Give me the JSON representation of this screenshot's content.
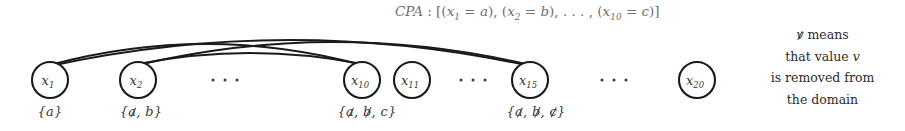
{
  "figure": {
    "width": 905,
    "height": 131,
    "background": "#ffffff",
    "stroke_color": "#1a1a1a",
    "text_color": "#3a3a3a",
    "cpa_text_color": "#6f6f6f"
  },
  "cpa": {
    "prefix": "CPA",
    "separator": " : ",
    "open_bracket": "[",
    "assignments": [
      {
        "var": "x",
        "index": "1",
        "eq": " = ",
        "value": "a"
      },
      {
        "var": "x",
        "index": "2",
        "eq": " = ",
        "value": "b"
      },
      {
        "var": "x",
        "index": "10",
        "eq": " = ",
        "value": "c"
      }
    ],
    "ellipsis": ", . . . ,",
    "close_bracket": "]",
    "full_text": "CPA : [(x1 = a), (x2 = b), . . . , (x10 = c)]"
  },
  "nodes": [
    {
      "id": "x1",
      "var": "x",
      "index": "1",
      "cx": 50,
      "cy": 80,
      "r": 18
    },
    {
      "id": "x2",
      "var": "x",
      "index": "2",
      "cx": 138,
      "cy": 80,
      "r": 18
    },
    {
      "id": "x10",
      "var": "x",
      "index": "10",
      "cx": 362,
      "cy": 80,
      "r": 18
    },
    {
      "id": "x11",
      "var": "x",
      "index": "11",
      "cx": 412,
      "cy": 80,
      "r": 18
    },
    {
      "id": "x15",
      "var": "x",
      "index": "15",
      "cx": 530,
      "cy": 80,
      "r": 18
    },
    {
      "id": "x20",
      "var": "x",
      "index": "20",
      "cx": 697,
      "cy": 80,
      "r": 18
    }
  ],
  "edges": [
    {
      "from": "x1",
      "to": "x10",
      "x1": 50,
      "y1": 65,
      "x2": 362,
      "y2": 65,
      "bow": 42
    },
    {
      "from": "x1",
      "to": "x15",
      "x1": 50,
      "y1": 66,
      "x2": 530,
      "y2": 66,
      "bow": 52
    },
    {
      "from": "x2",
      "to": "x10",
      "x1": 138,
      "y1": 64,
      "x2": 362,
      "y2": 64,
      "bow": 22
    },
    {
      "from": "x2",
      "to": "x15",
      "x1": 138,
      "y1": 65,
      "x2": 530,
      "y2": 65,
      "bow": 46
    }
  ],
  "domains": [
    {
      "node": "x1",
      "cx": 50,
      "text": "{a}",
      "open": "{",
      "close": "}",
      "values": [
        {
          "value": "a",
          "removed": false
        }
      ]
    },
    {
      "node": "x2",
      "cx": 141,
      "text": "{a, b}",
      "open": "{",
      "close": "}",
      "values": [
        {
          "value": "a",
          "removed": true
        },
        {
          "value": "b",
          "removed": false
        }
      ]
    },
    {
      "node": "x10",
      "cx": 367,
      "text": "{a, b, c}",
      "open": "{",
      "close": "}",
      "values": [
        {
          "value": "a",
          "removed": true
        },
        {
          "value": "b",
          "removed": true
        },
        {
          "value": "c",
          "removed": false
        }
      ]
    },
    {
      "node": "x15",
      "cx": 536,
      "text": "{a, b, c}",
      "open": "{",
      "close": "}",
      "values": [
        {
          "value": "a",
          "removed": true
        },
        {
          "value": "b",
          "removed": true
        },
        {
          "value": "c",
          "removed": true
        }
      ]
    }
  ],
  "ellipses": [
    {
      "id": "gap-x2-x10",
      "cx": 225,
      "cy": 80,
      "dots": 3
    },
    {
      "id": "gap-x11-x15",
      "cx": 473,
      "cy": 80,
      "dots": 3
    },
    {
      "id": "gap-x15-x20",
      "cx": 614,
      "cy": 80,
      "dots": 3
    }
  ],
  "legend": {
    "symbol": "v",
    "symbol_removed": true,
    "lines": [
      "means",
      "that value v",
      "is removed from",
      "the domain"
    ],
    "line1_prefix": "",
    "line1_suffix": " means",
    "line2_pre": "that value ",
    "line2_var": "v",
    "line3": "is removed from",
    "line4": "the domain",
    "full_text": "v means that value v is removed from the domain"
  }
}
